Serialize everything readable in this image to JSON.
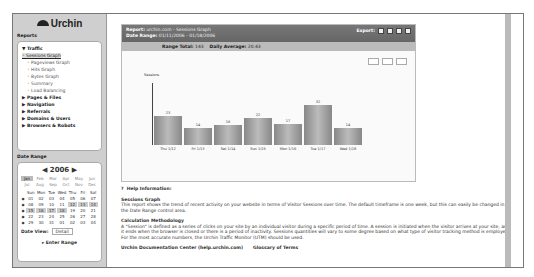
{
  "logo": "Urchin",
  "sidebar": {
    "reports_title": "Reports",
    "nav": [
      {
        "label": "▼ Traffic",
        "type": "top"
      },
      {
        "label": "Sessions Graph",
        "type": "sel"
      },
      {
        "label": "Pageviews Graph",
        "type": "sub"
      },
      {
        "label": "Hits Graph",
        "type": "sub"
      },
      {
        "label": "Bytes Graph",
        "type": "sub"
      },
      {
        "label": "Summary",
        "type": "sub"
      },
      {
        "label": "Load Balancing",
        "type": "sub"
      },
      {
        "label": "▶ Pages & Files",
        "type": "top"
      },
      {
        "label": "▶ Navigation",
        "type": "top"
      },
      {
        "label": "▶ Referrals",
        "type": "top"
      },
      {
        "label": "▶ Domains & Users",
        "type": "top"
      },
      {
        "label": "▶ Browsers & Robots",
        "type": "top"
      }
    ],
    "date_title": "Date Range",
    "calendar": {
      "year": "◀ 2006 ▶",
      "months": [
        "Jan",
        "Feb",
        "Mar",
        "Apr",
        "May",
        "Jun",
        "Jul",
        "Aug",
        "Sep",
        "Oct",
        "Nov",
        "Dec"
      ],
      "day_headers": [
        "",
        "Sun",
        "Mon",
        "Tue",
        "Wed",
        "Thu",
        "Fri",
        "Sat"
      ],
      "weeks": [
        [
          "01",
          "02",
          "03",
          "04",
          "05",
          "06",
          "07"
        ],
        [
          "08",
          "09",
          "10",
          "11",
          "12",
          "13",
          "14"
        ],
        [
          "15",
          "16",
          "17",
          "18",
          "19",
          "20",
          "21"
        ],
        [
          "22",
          "23",
          "24",
          "25",
          "26",
          "27",
          "28"
        ],
        [
          "29",
          "30",
          "31",
          "01",
          "02",
          "03",
          "04"
        ]
      ],
      "date_view_label": "Date View:",
      "date_view_value": "Detail",
      "enter_range": "▸ Enter Range"
    }
  },
  "report": {
    "report_label": "Report:",
    "report_value": "urchin.com - Sessions Graph",
    "range_label": "Date Range:",
    "range_value": "01/11/2006 - 01/18/2006",
    "export_label": "Export:",
    "range_total_label": "Range Total:",
    "range_total": "143",
    "daily_avg_label": "Daily Average:",
    "daily_avg": "20.43"
  },
  "chart_data": {
    "type": "bar",
    "ylabel": "Sessions",
    "categories": [
      "Thu 1/12",
      "Fri 1/13",
      "Sat 1/14",
      "Sun 1/15",
      "Mon 1/16",
      "Tue 1/17",
      "Wed 1/18"
    ],
    "values": [
      23,
      14,
      16,
      22,
      17,
      32,
      14
    ],
    "ylim": [
      0,
      50
    ]
  },
  "help": {
    "title": "Help Information:",
    "s1_title": "Sessions Graph",
    "s1_body": "This report shows the trend of recent activity on your website in terms of Visitor Sessions over time. The default timeframe is one week, but this can easily be changed in the Date Range control area.",
    "s2_title": "Calculation Methodology",
    "s2_body": "A \"Session\" is defined as a series of clicks on your site by an individual visitor during a specific period of time. A session is initiated when the visitor arrives at your site, and it ends when the browser is closed or there is a period of inactivity. Sessions quantities will vary to some degree based on what type of visitor tracking method is employed. For the most accurate numbers, the Urchin Traffic Monitor (UTM) should be used.",
    "link1": "Urchin Documentation Center (help.urchin.com)",
    "link2": "Glossary of Terms"
  }
}
